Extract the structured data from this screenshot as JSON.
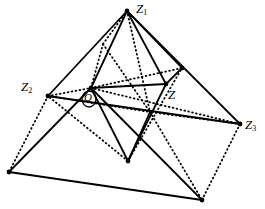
{
  "figure": {
    "canvas": {
      "width": 265,
      "height": 209,
      "background": "#ffffff"
    },
    "style": {
      "stroke_color": "#000000",
      "solid_width": 1.8,
      "dotted_width": 1.8,
      "dot_pattern": "0.8 3.2",
      "vertex_dot_radius": 2.4
    },
    "points": {
      "Z1": {
        "x": 127,
        "y": 11,
        "label": "Z",
        "sub": "1"
      },
      "Z2": {
        "x": 48,
        "y": 96,
        "label": "Z",
        "sub": "2"
      },
      "Z3": {
        "x": 240,
        "y": 124,
        "label": "Z",
        "sub": "3"
      },
      "Z": {
        "x": 166,
        "y": 84,
        "label": "Z",
        "sub": ""
      },
      "O": {
        "x": 91,
        "y": 88,
        "label": "O",
        "sub": ""
      },
      "B": {
        "x": 128,
        "y": 161,
        "label": "",
        "sub": ""
      },
      "R": {
        "x": 182,
        "y": 68,
        "label": "",
        "sub": ""
      },
      "BL": {
        "x": 9,
        "y": 172,
        "label": "",
        "sub": ""
      },
      "BR": {
        "x": 202,
        "y": 200,
        "label": "",
        "sub": ""
      },
      "M": {
        "x": 103,
        "y": 44,
        "label": "",
        "sub": ""
      },
      "D": {
        "x": 150,
        "y": 112,
        "label": "",
        "sub": ""
      }
    },
    "labels": [
      {
        "name": "vertex-label-z1",
        "text": "Z",
        "sub": "1",
        "x": 136,
        "y": 2
      },
      {
        "name": "vertex-label-z2",
        "text": "Z",
        "sub": "2",
        "x": 21,
        "y": 80
      },
      {
        "name": "vertex-label-z3",
        "text": "Z",
        "sub": "3",
        "x": 245,
        "y": 118
      },
      {
        "name": "vertex-label-z",
        "text": "Z",
        "sub": "",
        "x": 168,
        "y": 88
      },
      {
        "name": "angle-label-o",
        "text": "O",
        "sub": "",
        "x": 84,
        "y": 92
      }
    ],
    "edges": {
      "solid": [
        {
          "name": "edge-z1-z2",
          "from": "Z1",
          "to": "Z2"
        },
        {
          "name": "edge-z1-z3",
          "from": "Z1",
          "to": "Z3"
        },
        {
          "name": "edge-z2-z3",
          "from": "Z2",
          "to": "Z3"
        },
        {
          "name": "edge-z1-z",
          "from": "Z1",
          "to": "Z"
        },
        {
          "name": "edge-z1-r",
          "from": "Z1",
          "to": "R"
        },
        {
          "name": "edge-z-r",
          "from": "Z",
          "to": "R"
        },
        {
          "name": "edge-z1-o",
          "from": "Z1",
          "to": "O"
        },
        {
          "name": "edge-o-z",
          "from": "O",
          "to": "Z"
        },
        {
          "name": "edge-o-b",
          "from": "O",
          "to": "B"
        },
        {
          "name": "edge-z-b",
          "from": "Z",
          "to": "B"
        },
        {
          "name": "edge-o-bl",
          "from": "O",
          "to": "BL"
        },
        {
          "name": "edge-bl-br",
          "from": "BL",
          "to": "BR"
        },
        {
          "name": "edge-o-br",
          "from": "O",
          "to": "BR"
        },
        {
          "name": "edge-b-d",
          "from": "B",
          "to": "D"
        }
      ],
      "dotted": [
        {
          "name": "dotted-z2-bl",
          "from": "Z2",
          "to": "BL"
        },
        {
          "name": "dotted-z3-br",
          "from": "Z3",
          "to": "BR"
        },
        {
          "name": "dotted-z1-d",
          "from": "Z1",
          "to": "D"
        },
        {
          "name": "dotted-z2-d",
          "from": "Z2",
          "to": "D"
        },
        {
          "name": "dotted-z3-d",
          "from": "Z3",
          "to": "D"
        },
        {
          "name": "dotted-m-o",
          "from": "M",
          "to": "O"
        },
        {
          "name": "dotted-z1-m",
          "from": "Z1",
          "to": "M"
        },
        {
          "name": "dotted-m-d",
          "from": "M",
          "to": "D"
        },
        {
          "name": "dotted-o-r",
          "from": "O",
          "to": "R"
        },
        {
          "name": "dotted-o-z3",
          "from": "O",
          "to": "Z3"
        },
        {
          "name": "dotted-b-z2",
          "from": "B",
          "to": "Z2"
        },
        {
          "name": "dotted-z2-o",
          "from": "Z2",
          "to": "O"
        },
        {
          "name": "dotted-d-br",
          "from": "D",
          "to": "BR"
        },
        {
          "name": "dotted-b-r",
          "from": "B",
          "to": "R"
        }
      ],
      "vertex_dots": [
        "Z1",
        "Z2",
        "Z3",
        "Z",
        "O",
        "B",
        "R",
        "BL",
        "BR"
      ]
    },
    "angle_arc": {
      "name": "angle-arc-o",
      "center_x": 89,
      "center_y": 99,
      "rx": 7,
      "ry": 8
    }
  }
}
